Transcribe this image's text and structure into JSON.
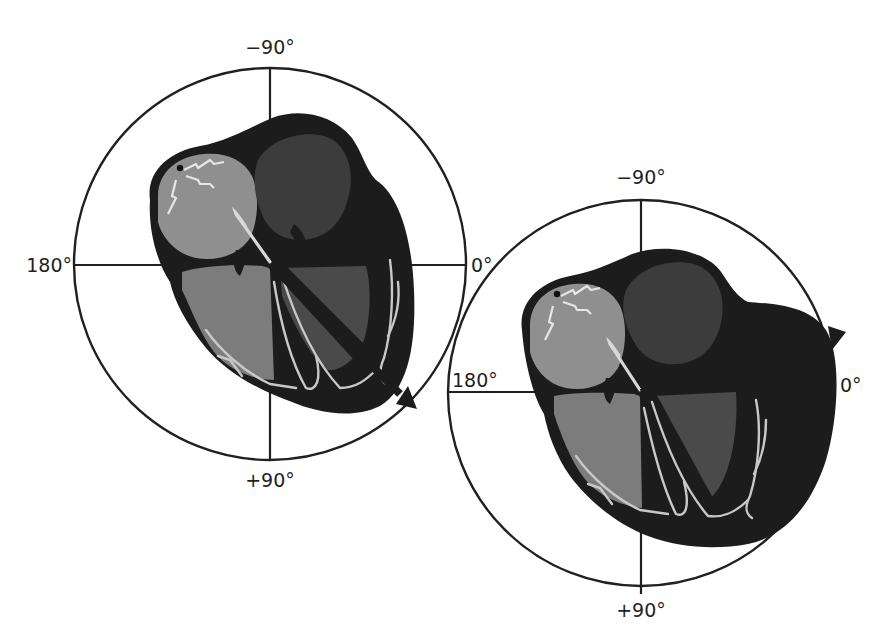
{
  "figure": {
    "colors": {
      "line": "#231f20",
      "heart_wall": "#1c1c1c",
      "right_atrium": "#8f8f8f",
      "left_atrium": "#3c3c3c",
      "right_ventricle": "#7c7c7c",
      "left_ventricle": "#4a4a4a",
      "conduction_fibers": "#c8c8c8",
      "background": "#ffffff"
    },
    "panels": [
      {
        "name": "normal-axis",
        "labels": {
          "top": "−90°",
          "left": "180°",
          "right": "0°",
          "bottom": "+90°"
        },
        "axis_vector": {
          "direction": "down-right",
          "approx_degrees": "+45°"
        },
        "variant": "normal heart"
      },
      {
        "name": "left-axis-deviation",
        "labels": {
          "top": "−90°",
          "left": "180°",
          "right": "0°",
          "bottom": "+90°"
        },
        "axis_vector": {
          "direction": "up-right",
          "approx_degrees": "−15°"
        },
        "variant": "enlarged left ventricle"
      }
    ]
  }
}
